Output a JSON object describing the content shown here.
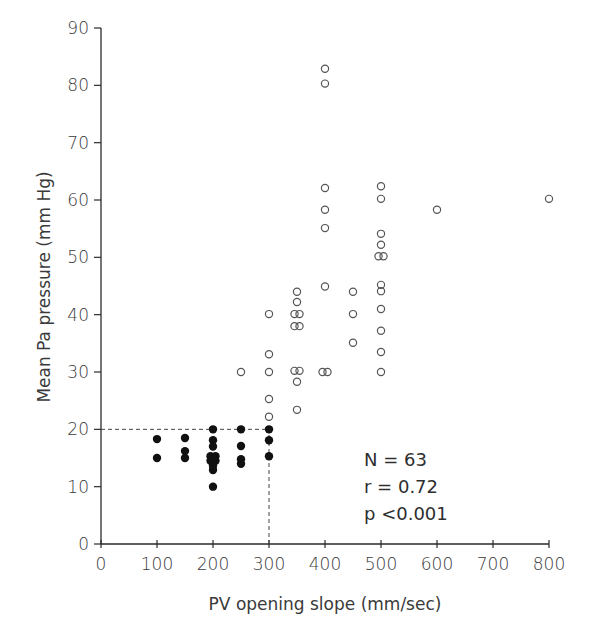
{
  "chart_data": {
    "type": "scatter",
    "title": "",
    "xlabel": "PV opening slope (mm/sec)",
    "ylabel": "Mean Pa pressure (mm Hg)",
    "xlim": [
      0,
      800
    ],
    "ylim": [
      0,
      90
    ],
    "xticks": [
      0,
      100,
      200,
      300,
      400,
      500,
      600,
      700,
      800
    ],
    "yticks": [
      0,
      10,
      20,
      30,
      40,
      50,
      60,
      70,
      80,
      90
    ],
    "grid": false,
    "legend": null,
    "reference_lines": [
      {
        "type": "horizontal",
        "y": 20,
        "x_from": 0,
        "x_to": 300,
        "style": "dashed"
      },
      {
        "type": "vertical",
        "x": 300,
        "y_from": 0,
        "y_to": 20,
        "style": "dashed"
      }
    ],
    "annotations": [
      {
        "text": "N = 63",
        "x": 470,
        "y": 13
      },
      {
        "text": "r  = 0.72",
        "x": 470,
        "y": 8.3
      },
      {
        "text": "p <0.001",
        "x": 470,
        "y": 3.6
      }
    ],
    "series": [
      {
        "name": "filled",
        "marker": "filled-circle",
        "points": [
          [
            100,
            18.3
          ],
          [
            100,
            15
          ],
          [
            150,
            18.5
          ],
          [
            150,
            16.2
          ],
          [
            150,
            15
          ],
          [
            200,
            20
          ],
          [
            200,
            18.1
          ],
          [
            200,
            17
          ],
          [
            200,
            15.3
          ],
          [
            200,
            15.3
          ],
          [
            200,
            14.5
          ],
          [
            200,
            14.5
          ],
          [
            200,
            13.6
          ],
          [
            200,
            12.9
          ],
          [
            200,
            10
          ],
          [
            250,
            20
          ],
          [
            250,
            17.1
          ],
          [
            250,
            14.8
          ],
          [
            250,
            14
          ],
          [
            300,
            20
          ],
          [
            300,
            18.1
          ],
          [
            300,
            15.3
          ]
        ]
      },
      {
        "name": "open",
        "marker": "open-circle",
        "points": [
          [
            250,
            30
          ],
          [
            300,
            40.1
          ],
          [
            300,
            33.1
          ],
          [
            300,
            30
          ],
          [
            300,
            25.3
          ],
          [
            300,
            22.2
          ],
          [
            350,
            44
          ],
          [
            350,
            42.2
          ],
          [
            350,
            40.1
          ],
          [
            350,
            40.1
          ],
          [
            350,
            38
          ],
          [
            350,
            38
          ],
          [
            350,
            30.2
          ],
          [
            350,
            30.2
          ],
          [
            350,
            28.3
          ],
          [
            350,
            23.4
          ],
          [
            400,
            82.9
          ],
          [
            400,
            80.3
          ],
          [
            400,
            62.1
          ],
          [
            400,
            58.3
          ],
          [
            400,
            55.1
          ],
          [
            400,
            44.9
          ],
          [
            400,
            30
          ],
          [
            400,
            30
          ],
          [
            450,
            44
          ],
          [
            450,
            40.1
          ],
          [
            450,
            35.1
          ],
          [
            500,
            62.4
          ],
          [
            500,
            60.2
          ],
          [
            500,
            54.1
          ],
          [
            500,
            52.2
          ],
          [
            500,
            50.2
          ],
          [
            500,
            50.2
          ],
          [
            500,
            45.2
          ],
          [
            500,
            44.1
          ],
          [
            500,
            41
          ],
          [
            500,
            37.2
          ],
          [
            500,
            33.5
          ],
          [
            500,
            30
          ],
          [
            600,
            58.3
          ],
          [
            800,
            60.2
          ]
        ]
      }
    ]
  },
  "stats": {
    "n_line": "N = 63",
    "r_line": "r  = 0.72",
    "p_line": "p <0.001"
  },
  "colors": {
    "axis": "#2a2a2a",
    "filled_marker": "#111111",
    "open_marker": "#555555"
  }
}
